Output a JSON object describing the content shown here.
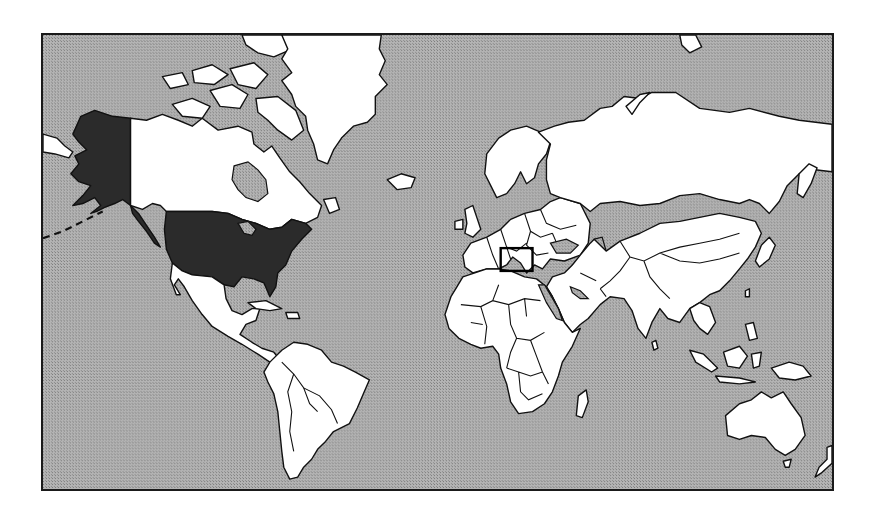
{
  "map": {
    "projection": "mercator-world",
    "colors": {
      "ocean": "#a8a8a8",
      "land": "#ffffff",
      "highlighted_country": "#2b2b2b",
      "border": "#111111"
    },
    "highlighted_regions": [
      {
        "name": "United States (contiguous)",
        "style": "dark-fill"
      },
      {
        "name": "Alaska",
        "style": "dark-fill"
      }
    ],
    "focus_box": {
      "region": "Levant / Eastern Mediterranean",
      "style": "black-rectangle-outline"
    }
  }
}
